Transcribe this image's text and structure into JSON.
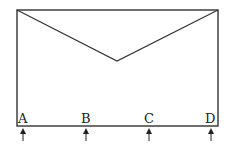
{
  "diagram": {
    "frame": {
      "x1": 17,
      "y1": 10,
      "x2": 218,
      "y2": 126,
      "stroke": "#333333"
    },
    "v_apex": {
      "x": 117,
      "y": 61
    },
    "supports": [
      {
        "label": "A",
        "x": 23
      },
      {
        "label": "B",
        "x": 86
      },
      {
        "label": "C",
        "x": 149
      },
      {
        "label": "D",
        "x": 211
      }
    ]
  }
}
